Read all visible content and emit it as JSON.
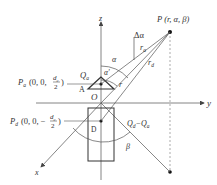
{
  "diagram": {
    "axes": {
      "z_label": "z",
      "y_label": "y",
      "x_label": "x",
      "origin_label": "O"
    },
    "point_P": {
      "label": "P (r, α, β)"
    },
    "point_Pa": {
      "name": "P",
      "sub": "a",
      "coords_prefix": "(0, 0, ",
      "num": "d",
      "num_sub": "c",
      "den": "2",
      "close": ")"
    },
    "point_Pd": {
      "name": "P",
      "sub": "d",
      "coords_prefix": "(0, 0, −",
      "num": "d",
      "num_sub": "c",
      "den": "2",
      "close": ")"
    },
    "labels": {
      "Qa": "Q",
      "Qa_sub": "a",
      "A": "A",
      "D": "D",
      "alpha": "α",
      "alpha_prime": "α'",
      "delta_alpha": "Δα",
      "r": "r",
      "ra": "r",
      "ra_sub": "a",
      "rd": "r",
      "rd_sub": "d",
      "beta": "β",
      "Qd_minus_Qa": "Q",
      "Qd_sub": "d",
      "minus": "−Q",
      "Qa2_sub": "a"
    },
    "colors": {
      "line": "#555555",
      "fill_dot": "#111111"
    }
  }
}
